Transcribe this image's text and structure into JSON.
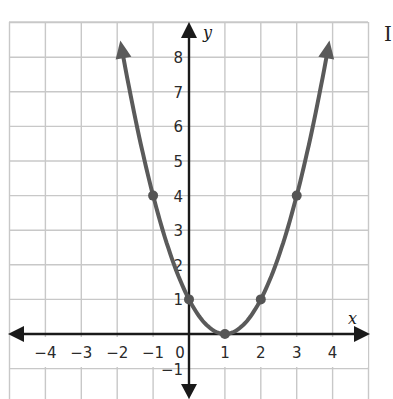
{
  "chart_data": {
    "type": "line",
    "title": "",
    "xlabel": "x",
    "ylabel": "y",
    "xlim": [
      -5,
      5
    ],
    "ylim": [
      -1.8,
      8.9
    ],
    "grid": true,
    "x_ticks": [
      "−4",
      "−3",
      "−2",
      "−1",
      "0",
      "1",
      "2",
      "3",
      "4"
    ],
    "y_ticks": [
      "−1",
      "1",
      "2",
      "3",
      "4",
      "5",
      "6",
      "7",
      "8"
    ],
    "function": "y = (x - 1)^2",
    "series": [
      {
        "name": "parabola",
        "x": [
          -1,
          0,
          1,
          2,
          3
        ],
        "values": [
          4,
          1,
          0,
          1,
          4
        ],
        "curve_extends_with_arrows": true
      }
    ],
    "points": [
      {
        "x": -1,
        "y": 4
      },
      {
        "x": 0,
        "y": 1
      },
      {
        "x": 1,
        "y": 0
      },
      {
        "x": 2,
        "y": 1
      },
      {
        "x": 3,
        "y": 4
      }
    ]
  },
  "colors": {
    "curve": "#5a5a5a",
    "axis": "#1a1a1a",
    "grid": "#c8c8c8",
    "point": "#555555"
  },
  "edge_text": "I"
}
